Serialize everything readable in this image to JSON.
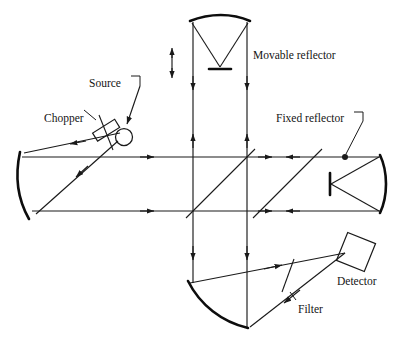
{
  "figure": {
    "type": "optical-interferometer-diagram",
    "background_color": "#ffffff",
    "line_color": "#1a1a1a"
  },
  "labels": {
    "source": "Source",
    "chopper": "Chopper",
    "movable_reflector": "Movable reflector",
    "fixed_reflector": "Fixed reflector",
    "detector": "Detector",
    "filter": "Filter"
  },
  "components": [
    {
      "name": "source",
      "label": "Source",
      "shape": "circle",
      "x": 123,
      "y": 135
    },
    {
      "name": "chopper",
      "label": "Chopper",
      "shape": "tilted-rectangle-blade",
      "x": 106,
      "y": 130
    },
    {
      "name": "left-collimating-mirror",
      "shape": "concave-arc",
      "x": 22,
      "y": 188
    },
    {
      "name": "beamsplitter-upper",
      "shape": "diagonal-line-45",
      "x": 220,
      "y": 184
    },
    {
      "name": "beamsplitter-lower",
      "shape": "diagonal-line-45",
      "x": 287,
      "y": 184
    },
    {
      "name": "movable-reflector",
      "label": "Movable reflector",
      "shape": "convex-arc-with-flat-mirror",
      "x": 220,
      "y": 25
    },
    {
      "name": "fixed-reflector",
      "label": "Fixed reflector",
      "shape": "concave-arc-with-flat-mirror",
      "x": 370,
      "y": 184
    },
    {
      "name": "bottom-focusing-mirror",
      "shape": "tilted-concave-arc",
      "x": 218,
      "y": 300
    },
    {
      "name": "filter",
      "label": "Filter",
      "shape": "short-line",
      "x": 290,
      "y": 288
    },
    {
      "name": "detector",
      "label": "Detector",
      "shape": "tilted-square",
      "x": 355,
      "y": 255
    }
  ],
  "beam_paths": {
    "horizontal_upper_y": 157,
    "horizontal_lower_y": 211,
    "vertical_left_x": 193,
    "vertical_right_x": 247,
    "direction_arrows": [
      "right",
      "left",
      "up",
      "down"
    ]
  }
}
